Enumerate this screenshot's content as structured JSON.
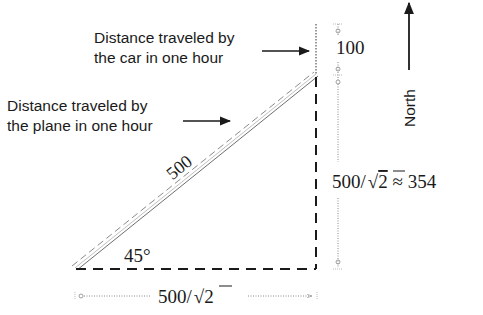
{
  "diagram": {
    "type": "right-triangle-vector-diagram",
    "colors": {
      "background": "#ffffff",
      "ink": "#1a1a1a",
      "dimension_line": "#888888",
      "hypotenuse_outline": "#6e6e6e"
    },
    "labels": {
      "car_line1": "Distance traveled by",
      "car_line2": "the car in one hour",
      "plane_line1": "Distance traveled by",
      "plane_line2": "the plane in one hour",
      "north": "North",
      "hypotenuse": "500",
      "angle": "45°",
      "top_segment": "100",
      "vertical_leg_prefix": "500/",
      "vertical_leg_radicand": "2",
      "vertical_leg_suffix": " ≈ 354",
      "horizontal_leg_prefix": "500/",
      "horizontal_leg_radicand": "2"
    },
    "values": {
      "plane_distance": 500,
      "car_distance": 100,
      "angle_degrees": 45,
      "leg_length_exact": "500/√2",
      "leg_length_approx": 354
    },
    "icons": {
      "north_arrow": "arrow-up-icon",
      "car_pointer": "arrow-right-icon",
      "plane_pointer": "arrow-right-icon"
    }
  }
}
